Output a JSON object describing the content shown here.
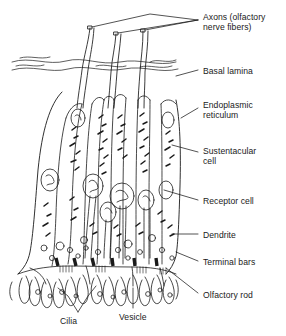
{
  "figure": {
    "background_color": "#ffffff",
    "ink_color": "#1a1a1a",
    "width": 286,
    "height": 336
  },
  "labels": [
    {
      "id": "axons",
      "text": "Axons (olfactory\nnerve fibers)",
      "x": 203,
      "y": 12
    },
    {
      "id": "basal-lamina",
      "text": "Basal lamina",
      "x": 203,
      "y": 66
    },
    {
      "id": "endoplasmic",
      "text": "Endoplasmic\nreticulum",
      "x": 203,
      "y": 100
    },
    {
      "id": "sustentacular",
      "text": "Sustentacular\ncell",
      "x": 203,
      "y": 146
    },
    {
      "id": "receptor-cell",
      "text": "Receptor cell",
      "x": 203,
      "y": 196
    },
    {
      "id": "dendrite",
      "text": "Dendrite",
      "x": 203,
      "y": 230
    },
    {
      "id": "terminal-bars",
      "text": "Terminal bars",
      "x": 203,
      "y": 257
    },
    {
      "id": "olfactory-rod",
      "text": "Olfactory rod",
      "x": 203,
      "y": 290
    },
    {
      "id": "cilia",
      "text": "Cilia",
      "x": 60,
      "y": 316
    },
    {
      "id": "vesicle",
      "text": "Vesicle",
      "x": 119,
      "y": 312
    }
  ],
  "structures": {
    "axon_count": 3,
    "cell_columns": 6,
    "terminal_bar_count": 6,
    "has_basal_lamina": true,
    "has_cilia_border": true
  }
}
